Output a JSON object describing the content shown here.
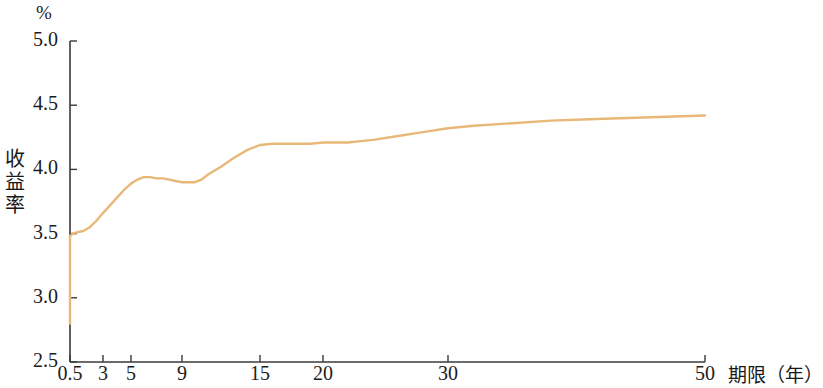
{
  "chart_data": {
    "type": "line",
    "title": "",
    "subtitle": "",
    "unit_label": "%",
    "ylabel": "收益率",
    "xlabel": "期限（年）",
    "xtick_labels": [
      "0.5",
      "3",
      "5",
      "9",
      "15",
      "20",
      "30",
      "50"
    ],
    "xtick_values": [
      0.5,
      3,
      5,
      9,
      15,
      20,
      30,
      50
    ],
    "ytick_labels": [
      "5.0",
      "4.5",
      "4.0",
      "3.5",
      "3.0",
      "2.5"
    ],
    "ytick_values": [
      5.0,
      4.5,
      4.0,
      3.5,
      3.0,
      2.5
    ],
    "ylim": [
      2.5,
      5.0
    ],
    "xlim": [
      0.5,
      50
    ],
    "grid": false,
    "legend": "none",
    "series": [
      {
        "name": "收益率曲线",
        "color": "#e8b878",
        "x": [
          0.5,
          0.5,
          0.7,
          1.0,
          1.5,
          2.0,
          2.5,
          3.0,
          3.5,
          4.0,
          4.5,
          5.0,
          5.5,
          6.0,
          6.5,
          7.0,
          7.5,
          8.0,
          8.5,
          9.0,
          9.5,
          10.0,
          10.5,
          11.0,
          12.0,
          13.0,
          14.0,
          15.0,
          16.0,
          17.0,
          18.0,
          19.0,
          20.0,
          21.0,
          22.0,
          23.0,
          24.0,
          26.0,
          28.0,
          30.0,
          32.0,
          35.0,
          38.0,
          41.0,
          44.0,
          47.0,
          50.0
        ],
        "y": [
          2.8,
          3.48,
          3.5,
          3.51,
          3.52,
          3.55,
          3.6,
          3.66,
          3.72,
          3.78,
          3.84,
          3.89,
          3.92,
          3.94,
          3.94,
          3.93,
          3.93,
          3.92,
          3.91,
          3.9,
          3.9,
          3.9,
          3.92,
          3.96,
          4.02,
          4.09,
          4.15,
          4.19,
          4.2,
          4.2,
          4.2,
          4.2,
          4.21,
          4.21,
          4.21,
          4.22,
          4.23,
          4.26,
          4.29,
          4.32,
          4.34,
          4.36,
          4.38,
          4.39,
          4.4,
          4.41,
          4.42
        ]
      }
    ]
  },
  "axes": {
    "axis_color": "#3a3a3a",
    "tick_color": "#3a3a3a"
  }
}
